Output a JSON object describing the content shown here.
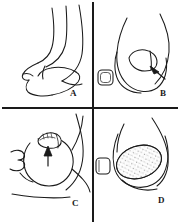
{
  "figure": {
    "type": "medical-line-drawing-plate",
    "layout": "2x2 grid of four panels separated by black divider lines",
    "background_color": "#ffffff",
    "ink_color": "#1a1a1a",
    "width_px": 179,
    "height_px": 224
  },
  "dividers": {
    "vertical_x": 93,
    "horizontal_y": 108,
    "color": "#1a1a1a",
    "thickness_px": 2
  },
  "panels": [
    {
      "id": "panel-a",
      "label": "A",
      "position": "top-left",
      "caption": "",
      "description": "Line drawing of a great toe viewed from the side with the nail plate absent; curved contour lines outline the toe pulp and the proximal nail fold.",
      "features": [
        "toe-outline",
        "nail-fold-curves",
        "pulp-contour"
      ],
      "markers": []
    },
    {
      "id": "panel-b",
      "label": "B",
      "position": "top-right",
      "caption": "",
      "description": "Line drawing of the toe tip showing a rounded nail remnant with an arrow pointing to the lateral nail edge; a small rounded-square nail appears at the left margin.",
      "features": [
        "toe-outline",
        "nail-plate",
        "adjacent-toenail"
      ],
      "markers": [
        "arrow"
      ]
    },
    {
      "id": "panel-c",
      "label": "C",
      "position": "bottom-left",
      "caption": "",
      "description": "Line drawing of a toe tip with a small crescent nail remnant at the top; a vertical arrow points upward at the nail remnant, and a looped contour marks the adjacent digit.",
      "features": [
        "toe-outline",
        "nail-remnant",
        "adjacent-digit-loop"
      ],
      "markers": [
        "arrow-up"
      ]
    },
    {
      "id": "panel-d",
      "label": "D",
      "position": "bottom-right",
      "caption": "",
      "description": "Line drawing of the toe tip bearing a large oval stippled lesion covering the nail bed; a small rounded-square nail of the adjacent toe is at the left margin.",
      "features": [
        "toe-outline",
        "stippled-oval-lesion",
        "adjacent-toenail"
      ],
      "markers": []
    }
  ],
  "labels": {
    "a": "A",
    "b": "B",
    "c": "C",
    "d": "D"
  }
}
